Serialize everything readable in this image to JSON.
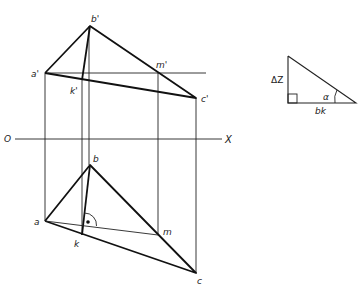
{
  "diagram": {
    "axis": {
      "left_label": "O",
      "right_label": "X"
    },
    "front_view": {
      "points": {
        "a_prime": {
          "label": "a'",
          "x": 45,
          "y": 73
        },
        "b_prime": {
          "label": "b'",
          "x": 90,
          "y": 26
        },
        "c_prime": {
          "label": "c'",
          "x": 196,
          "y": 98
        },
        "k_prime": {
          "label": "k'",
          "x": 82,
          "y": 80
        },
        "m_prime": {
          "label": "m'",
          "x": 158,
          "y": 73
        }
      }
    },
    "top_view": {
      "points": {
        "a": {
          "label": "a",
          "x": 45,
          "y": 221
        },
        "b": {
          "label": "b",
          "x": 90,
          "y": 165
        },
        "c": {
          "label": "c",
          "x": 196,
          "y": 273
        },
        "k": {
          "label": "k",
          "x": 82,
          "y": 235
        },
        "m": {
          "label": "m",
          "x": 158,
          "y": 235
        }
      },
      "right_angle_marker": "bk ⟂ am"
    },
    "auxiliary_triangle": {
      "vertical_label": "ΔZ",
      "horizontal_label": "bk",
      "angle_label": "α"
    }
  }
}
